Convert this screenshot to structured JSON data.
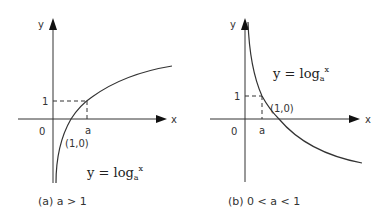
{
  "panels": [
    {
      "id": "a",
      "y_axis_label": "y",
      "x_axis_label": "x",
      "origin_label": "0",
      "one_label": "1",
      "a_label": "a",
      "point_label": "(1,0)",
      "equation": {
        "main": "y = log",
        "sub": "a",
        "sup": "x"
      },
      "caption": "(a)  a > 1"
    },
    {
      "id": "b",
      "y_axis_label": "y",
      "x_axis_label": "x",
      "origin_label": "0",
      "one_label": "1",
      "a_label": "a",
      "point_label": "(1,0)",
      "equation": {
        "main": "y = log",
        "sub": "a",
        "sup": "x"
      },
      "caption": "(b) 0 < a < 1"
    }
  ],
  "colors": {
    "line": "#333333",
    "background": "#ffffff"
  }
}
